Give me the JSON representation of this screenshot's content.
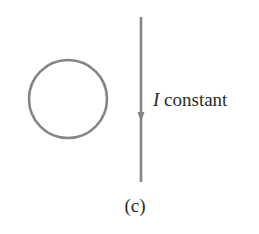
{
  "figure": {
    "current_symbol": "I",
    "current_label": " constant",
    "caption": "(c)"
  },
  "colors": {
    "stroke": "#808080",
    "text": "#2b2b2b"
  }
}
